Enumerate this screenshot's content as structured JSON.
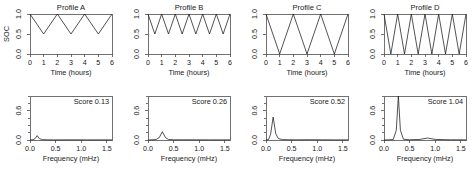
{
  "figure": {
    "rows": 2,
    "cols": 4,
    "background": "#ffffff",
    "line_color": "#1a1a1a",
    "axis_color": "#4d4d4d"
  },
  "chart_data": [
    {
      "type": "line",
      "panel_index": 0,
      "row": "top",
      "title": "Profile A",
      "xlabel": "Time (hours)",
      "ylabel": "SOC",
      "xlim": [
        0,
        6
      ],
      "ylim": [
        0,
        1
      ],
      "xticks": [
        0,
        1,
        2,
        3,
        4,
        5,
        6
      ],
      "xticklabels": [
        "0",
        "1",
        "2",
        "3",
        "4",
        "5",
        "6"
      ],
      "yticks": [
        0.0,
        0.5,
        1.0
      ],
      "yticklabels": [
        "0.0",
        "0.5",
        "1.0"
      ],
      "grid": false,
      "legend": false,
      "waveform": "triangle",
      "cycles": 3,
      "soc_max": 1.0,
      "soc_min": 0.5,
      "depth_of_discharge": 0.5,
      "x": [
        0,
        1,
        2,
        3,
        4,
        5,
        6
      ],
      "y": [
        1.0,
        0.5,
        1.0,
        0.5,
        1.0,
        0.5,
        1.0
      ]
    },
    {
      "type": "line",
      "panel_index": 1,
      "row": "top",
      "title": "Profile B",
      "xlabel": "Time (hours)",
      "ylabel": "",
      "xlim": [
        0,
        6
      ],
      "ylim": [
        0,
        1
      ],
      "xticks": [
        0,
        1,
        2,
        3,
        4,
        5,
        6
      ],
      "xticklabels": [
        "0",
        "1",
        "2",
        "3",
        "4",
        "5",
        "6"
      ],
      "yticks": [
        0.0,
        0.5,
        1.0
      ],
      "yticklabels": [
        "0.0",
        "0.5",
        "1.0"
      ],
      "grid": false,
      "legend": false,
      "waveform": "triangle",
      "cycles": 6,
      "soc_max": 1.0,
      "soc_min": 0.5,
      "depth_of_discharge": 0.5,
      "x": [
        0,
        0.5,
        1,
        1.5,
        2,
        2.5,
        3,
        3.5,
        4,
        4.5,
        5,
        5.5,
        6
      ],
      "y": [
        1.0,
        0.5,
        1.0,
        0.5,
        1.0,
        0.5,
        1.0,
        0.5,
        1.0,
        0.5,
        1.0,
        0.5,
        1.0
      ]
    },
    {
      "type": "line",
      "panel_index": 2,
      "row": "top",
      "title": "Profile C",
      "xlabel": "Time (hours)",
      "ylabel": "",
      "xlim": [
        0,
        6
      ],
      "ylim": [
        0,
        1
      ],
      "xticks": [
        0,
        1,
        2,
        3,
        4,
        5,
        6
      ],
      "xticklabels": [
        "0",
        "1",
        "2",
        "3",
        "4",
        "5",
        "6"
      ],
      "yticks": [
        0.0,
        0.5,
        1.0
      ],
      "yticklabels": [
        "0.0",
        "0.5",
        "1.0"
      ],
      "grid": false,
      "legend": false,
      "waveform": "triangle",
      "cycles": 3,
      "soc_max": 1.0,
      "soc_min": 0.0,
      "depth_of_discharge": 1.0,
      "x": [
        0,
        1,
        2,
        3,
        4,
        5,
        6
      ],
      "y": [
        1.0,
        0.0,
        1.0,
        0.0,
        1.0,
        0.0,
        1.0
      ]
    },
    {
      "type": "line",
      "panel_index": 3,
      "row": "top",
      "title": "Profile D",
      "xlabel": "Time (hours)",
      "ylabel": "",
      "xlim": [
        0,
        6
      ],
      "ylim": [
        0,
        1
      ],
      "xticks": [
        0,
        1,
        2,
        3,
        4,
        5,
        6
      ],
      "xticklabels": [
        "0",
        "1",
        "2",
        "3",
        "4",
        "5",
        "6"
      ],
      "yticks": [
        0.0,
        0.5,
        1.0
      ],
      "yticklabels": [
        "0.0",
        "0.5",
        "1.0"
      ],
      "grid": false,
      "legend": false,
      "waveform": "triangle",
      "cycles": 6,
      "soc_max": 1.0,
      "soc_min": 0.0,
      "depth_of_discharge": 1.0,
      "x": [
        0,
        0.5,
        1,
        1.5,
        2,
        2.5,
        3,
        3.5,
        4,
        4.5,
        5,
        5.5,
        6
      ],
      "y": [
        1.0,
        0.0,
        1.0,
        0.0,
        1.0,
        0.0,
        1.0,
        0.0,
        1.0,
        0.0,
        1.0,
        0.0,
        1.0
      ]
    },
    {
      "type": "line",
      "panel_index": 4,
      "row": "bottom",
      "title": "",
      "annotation": "Score 0.13",
      "xlabel": "Frequency (mHz)",
      "ylabel": "",
      "xlim": [
        0,
        1.6
      ],
      "ylim": [
        0,
        0.9
      ],
      "xticks": [
        0.0,
        0.5,
        1.0,
        1.5
      ],
      "xticklabels": [
        "0.0",
        "0.5",
        "1.0",
        "1.5"
      ],
      "yticks": [
        0.0,
        0.6
      ],
      "yticklabels": [
        "0.0",
        "0.6"
      ],
      "grid": false,
      "legend": false,
      "peak_frequency_mhz": 0.14,
      "peak_amplitude": 0.09,
      "x": [
        0.0,
        0.06,
        0.1,
        0.14,
        0.18,
        0.24,
        0.34,
        0.46,
        0.6,
        0.85,
        1.1,
        1.35,
        1.6
      ],
      "y": [
        0.0,
        0.005,
        0.03,
        0.09,
        0.03,
        0.008,
        0.004,
        0.003,
        0.003,
        0.004,
        0.003,
        0.003,
        0.003
      ]
    },
    {
      "type": "line",
      "panel_index": 5,
      "row": "bottom",
      "title": "",
      "annotation": "Score 0.26",
      "xlabel": "Frequency (mHz)",
      "ylabel": "",
      "xlim": [
        0,
        1.6
      ],
      "ylim": [
        0,
        0.9
      ],
      "xticks": [
        0.0,
        0.5,
        1.0,
        1.5
      ],
      "xticklabels": [
        "0.0",
        "0.5",
        "1.0",
        "1.5"
      ],
      "yticks": [
        0.0,
        0.6
      ],
      "yticklabels": [
        "0.0",
        "0.6"
      ],
      "grid": false,
      "legend": false,
      "peak_frequency_mhz": 0.28,
      "peak_amplitude": 0.17,
      "x": [
        0.0,
        0.08,
        0.16,
        0.22,
        0.28,
        0.34,
        0.4,
        0.5,
        0.7,
        0.95,
        1.2,
        1.4,
        1.6
      ],
      "y": [
        0.0,
        0.004,
        0.01,
        0.05,
        0.17,
        0.05,
        0.012,
        0.005,
        0.004,
        0.004,
        0.003,
        0.003,
        0.003
      ]
    },
    {
      "type": "line",
      "panel_index": 6,
      "row": "bottom",
      "title": "",
      "annotation": "Score 0.52",
      "xlabel": "Frequency (mHz)",
      "ylabel": "",
      "xlim": [
        0,
        1.6
      ],
      "ylim": [
        0,
        0.9
      ],
      "xticks": [
        0.0,
        0.5,
        1.0,
        1.5
      ],
      "xticklabels": [
        "0.0",
        "0.5",
        "1.0",
        "1.5"
      ],
      "yticks": [
        0.0,
        0.6
      ],
      "yticklabels": [
        "0.0",
        "0.6"
      ],
      "grid": false,
      "legend": false,
      "peak_frequency_mhz": 0.14,
      "peak_amplitude": 0.47,
      "x": [
        0.0,
        0.05,
        0.09,
        0.14,
        0.19,
        0.24,
        0.32,
        0.45,
        0.62,
        0.85,
        1.1,
        1.35,
        1.6
      ],
      "y": [
        0.0,
        0.01,
        0.12,
        0.47,
        0.13,
        0.03,
        0.008,
        0.005,
        0.004,
        0.006,
        0.004,
        0.003,
        0.003
      ]
    },
    {
      "type": "line",
      "panel_index": 7,
      "row": "bottom",
      "title": "",
      "annotation": "Score 1.04",
      "xlabel": "Frequency (mHz)",
      "ylabel": "",
      "xlim": [
        0,
        1.6
      ],
      "ylim": [
        0,
        0.9
      ],
      "xticks": [
        0.0,
        0.5,
        1.0,
        1.5
      ],
      "xticklabels": [
        "0.0",
        "0.5",
        "1.0",
        "1.5"
      ],
      "yticks": [
        0.0,
        0.6
      ],
      "yticklabels": [
        "0.0",
        "0.6"
      ],
      "grid": false,
      "legend": false,
      "peak_frequency_mhz": 0.28,
      "peak_amplitude": 0.9,
      "secondary_peak_frequency_mhz": 0.85,
      "secondary_peak_amplitude": 0.04,
      "x": [
        0.0,
        0.1,
        0.18,
        0.24,
        0.28,
        0.32,
        0.38,
        0.5,
        0.7,
        0.85,
        1.0,
        1.3,
        1.6
      ],
      "y": [
        0.0,
        0.004,
        0.01,
        0.2,
        0.9,
        0.2,
        0.015,
        0.005,
        0.012,
        0.04,
        0.012,
        0.004,
        0.004
      ]
    }
  ]
}
